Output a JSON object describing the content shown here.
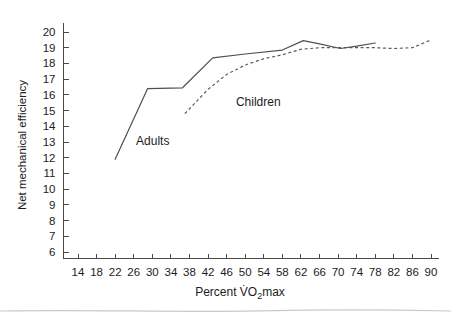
{
  "chart_data": {
    "type": "line",
    "title": "",
    "xlabel": "Percent V̇O2max",
    "xlabel_parts": {
      "prefix": "Percent ",
      "vdot": "V̇",
      "o": "O",
      "sub": "2",
      "suffix": "max"
    },
    "ylabel": "Net mechanical efficiency",
    "xlim": [
      12,
      92
    ],
    "ylim": [
      5.2,
      20.6
    ],
    "grid": false,
    "legend": "inline-annotations",
    "xticks": [
      14,
      18,
      22,
      26,
      30,
      34,
      38,
      42,
      46,
      50,
      54,
      58,
      62,
      66,
      70,
      74,
      78,
      82,
      86,
      90
    ],
    "yticks": [
      6,
      7,
      8,
      9,
      10,
      11,
      12,
      13,
      14,
      15,
      16,
      17,
      18,
      19,
      20
    ],
    "xtick_labels": [
      "14",
      "18",
      "22",
      "26",
      "30",
      "34",
      "38",
      "42",
      "46",
      "50",
      "54",
      "58",
      "62",
      "66",
      "70",
      "74",
      "78",
      "82",
      "86",
      "90"
    ],
    "ytick_labels": [
      "6",
      "7",
      "8",
      "9",
      "10",
      "11",
      "12",
      "13",
      "14",
      "15",
      "16",
      "17",
      "18",
      "19",
      "20"
    ],
    "series": [
      {
        "name": "Adults",
        "style": "solid",
        "annotation": "Adults",
        "x": [
          22.0,
          29.0,
          36.5,
          43.0,
          50.0,
          58.0,
          62.5,
          66.0,
          70.5,
          74.0,
          78.0
        ],
        "values": [
          11.9,
          16.4,
          16.45,
          18.35,
          18.6,
          18.85,
          19.45,
          19.25,
          18.95,
          19.1,
          19.3
        ]
      },
      {
        "name": "Children",
        "style": "dashed",
        "annotation": "Children",
        "x": [
          37.0,
          42.0,
          46.0,
          50.0,
          54.0,
          58.0,
          62.0,
          66.0,
          70.0,
          74.0,
          78.0,
          82.0,
          86.0,
          90.0
        ],
        "values": [
          14.8,
          16.35,
          17.3,
          17.9,
          18.3,
          18.55,
          18.9,
          19.0,
          19.0,
          19.0,
          19.0,
          18.95,
          19.0,
          19.5
        ]
      }
    ],
    "annotations": [
      {
        "text": "Adults",
        "x": 26.5,
        "y": 12.8
      },
      {
        "text": "Children",
        "x": 48.0,
        "y": 15.3
      }
    ]
  }
}
